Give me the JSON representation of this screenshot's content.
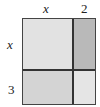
{
  "diagram": {
    "type": "area-model",
    "top_labels": [
      "x",
      "2"
    ],
    "left_labels": [
      "x",
      "3"
    ],
    "cells": [
      {
        "row": 0,
        "col": 0,
        "color": "#e2e2e2"
      },
      {
        "row": 0,
        "col": 1,
        "color": "#b8b8b8"
      },
      {
        "row": 1,
        "col": 0,
        "color": "#d3d3d3"
      },
      {
        "row": 1,
        "col": 1,
        "color": "#e4e4e4"
      }
    ]
  }
}
